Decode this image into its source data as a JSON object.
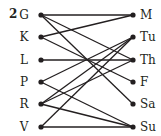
{
  "problem_number": "2",
  "left_nodes": [
    {
      "label": "G",
      "y": 15
    },
    {
      "label": "K",
      "y": 37
    },
    {
      "label": "L",
      "y": 60
    },
    {
      "label": "P",
      "y": 82
    },
    {
      "label": "R",
      "y": 104
    },
    {
      "label": "V",
      "y": 127
    }
  ],
  "right_nodes": [
    {
      "label": "M",
      "y": 15
    },
    {
      "label": "Tu",
      "y": 37
    },
    {
      "label": "Th",
      "y": 60
    },
    {
      "label": "F",
      "y": 82
    },
    {
      "label": "Sa",
      "y": 104
    },
    {
      "label": "Su",
      "y": 127
    }
  ],
  "edges": [
    [
      "G",
      "M"
    ],
    [
      "G",
      "Th"
    ],
    [
      "G",
      "Sa"
    ],
    [
      "K",
      "M"
    ],
    [
      "K",
      "F"
    ],
    [
      "L",
      "Th"
    ],
    [
      "P",
      "Tu"
    ],
    [
      "P",
      "Su"
    ],
    [
      "R",
      "Tu"
    ],
    [
      "R",
      "Th"
    ],
    [
      "R",
      "Su"
    ],
    [
      "V",
      "Tu"
    ],
    [
      "V",
      "Su"
    ]
  ],
  "colors": {
    "ink": "#231f20"
  }
}
